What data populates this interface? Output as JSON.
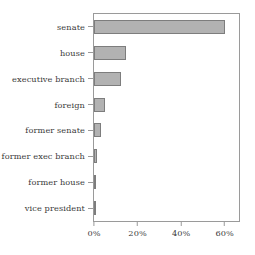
{
  "chart_data": {
    "type": "bar",
    "orientation": "horizontal",
    "title": "",
    "subtitle": "",
    "xlabel": "",
    "ylabel": "",
    "categories": [
      "senate",
      "house",
      "executive branch",
      "foreign",
      "former senate",
      "former exec branch",
      "former house",
      "vice president"
    ],
    "values": [
      60.0,
      14.5,
      12.5,
      5.0,
      3.0,
      1.5,
      0.8,
      0.8
    ],
    "value_unit": "%",
    "xlim": [
      0,
      67
    ],
    "xticks": [
      0,
      20,
      40,
      60
    ],
    "xtick_labels": [
      "0%",
      "20%",
      "40%",
      "60%"
    ],
    "grid": false,
    "legend": false,
    "legend_position": "none",
    "bar_fill_color": "#b2b2b2",
    "bar_edge_color": "#7d7d7d",
    "axis_color": "#9a9a9a",
    "text_color": "#3a3a3a",
    "background_color": "#ffffff"
  }
}
